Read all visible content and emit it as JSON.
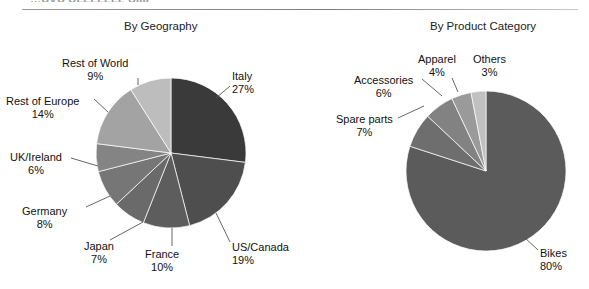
{
  "page": {
    "cut_off_header": "…UVU ULLLLLLL UIIII",
    "background": "#ffffff"
  },
  "charts": [
    {
      "id": "by-geography",
      "title": "By Geography",
      "center": {
        "x": 171,
        "y": 153
      },
      "radius": 75,
      "labels": [
        {
          "name": "rest-of-world",
          "text": "Rest of World",
          "pct": "9%",
          "x": 62,
          "y": 57,
          "align": "center",
          "leader": {
            "x1": 138,
            "y1": 78,
            "x2": 138,
            "y2": 85
          }
        },
        {
          "name": "rest-of-europe",
          "text": "Rest of Europe",
          "pct": "14%",
          "x": 6,
          "y": 95,
          "align": "center",
          "leader": {
            "x1": 94,
            "y1": 99,
            "x2": 108,
            "y2": 112
          }
        },
        {
          "name": "uk-ireland",
          "text": "UK/Ireland",
          "pct": "6%",
          "x": 10,
          "y": 151,
          "align": "center",
          "leader": {
            "x1": 71,
            "y1": 158,
            "x2": 98,
            "y2": 166
          }
        },
        {
          "name": "germany",
          "text": "Germany",
          "pct": "8%",
          "x": 22,
          "y": 205,
          "align": "center",
          "leader": {
            "x1": 86,
            "y1": 207,
            "x2": 110,
            "y2": 196
          }
        },
        {
          "name": "japan",
          "text": "Japan",
          "pct": "7%",
          "x": 84,
          "y": 240,
          "align": "center",
          "leader": {
            "x1": 110,
            "y1": 240,
            "x2": 143,
            "y2": 222
          }
        },
        {
          "name": "france",
          "text": "France",
          "pct": "10%",
          "x": 145,
          "y": 248,
          "align": "center",
          "leader": {
            "x1": 172,
            "y1": 246,
            "x2": 172,
            "y2": 228
          }
        },
        {
          "name": "us-canada",
          "text": "US/Canada",
          "pct": "19%",
          "x": 232,
          "y": 241,
          "align": "left",
          "leader": {
            "x1": 230,
            "y1": 242,
            "x2": 216,
            "y2": 213
          }
        },
        {
          "name": "italy",
          "text": "Italy",
          "pct": "27%",
          "x": 232,
          "y": 70,
          "align": "left",
          "leader": {
            "x1": 230,
            "y1": 86,
            "x2": 216,
            "y2": 98
          }
        }
      ],
      "slices": [
        {
          "name": "Italy",
          "value": 27,
          "color": "#3a3a3a"
        },
        {
          "name": "US/Canada",
          "value": 19,
          "color": "#4e4e4e"
        },
        {
          "name": "France",
          "value": 10,
          "color": "#5d5d5d"
        },
        {
          "name": "Japan",
          "value": 7,
          "color": "#6a6a6a"
        },
        {
          "name": "Germany",
          "value": 8,
          "color": "#767676"
        },
        {
          "name": "UK/Ireland",
          "value": 6,
          "color": "#848484"
        },
        {
          "name": "Rest of Europe",
          "value": 14,
          "color": "#a3a3a3"
        },
        {
          "name": "Rest of World",
          "value": 9,
          "color": "#bdbdbd"
        }
      ]
    },
    {
      "id": "by-product-category",
      "title": "By Product Category",
      "center": {
        "x": 486,
        "y": 171
      },
      "radius": 80,
      "labels": [
        {
          "name": "others",
          "text": "Others",
          "pct": "3%",
          "x": 473,
          "y": 53,
          "align": "center",
          "leader": null
        },
        {
          "name": "apparel",
          "text": "Apparel",
          "pct": "4%",
          "x": 418,
          "y": 53,
          "align": "center",
          "leader": {
            "x1": 452,
            "y1": 78,
            "x2": 458,
            "y2": 92
          }
        },
        {
          "name": "accessories",
          "text": "Accessories",
          "pct": "6%",
          "x": 354,
          "y": 74,
          "align": "center",
          "leader": {
            "x1": 422,
            "y1": 79,
            "x2": 442,
            "y2": 96
          }
        },
        {
          "name": "spare-parts",
          "text": "Spare parts",
          "pct": "7%",
          "x": 336,
          "y": 113,
          "align": "center",
          "leader": {
            "x1": 398,
            "y1": 118,
            "x2": 424,
            "y2": 106
          }
        },
        {
          "name": "bikes",
          "text": "Bikes",
          "pct": "80%",
          "x": 540,
          "y": 247,
          "align": "left",
          "leader": {
            "x1": 538,
            "y1": 250,
            "x2": 524,
            "y2": 237
          }
        }
      ],
      "slices": [
        {
          "name": "Bikes",
          "value": 80,
          "color": "#5b5b5b"
        },
        {
          "name": "Spare parts",
          "value": 7,
          "color": "#6e6e6e"
        },
        {
          "name": "Accessories",
          "value": 6,
          "color": "#828282"
        },
        {
          "name": "Apparel",
          "value": 4,
          "color": "#9a9a9a"
        },
        {
          "name": "Others",
          "value": 3,
          "color": "#c0c0c0"
        }
      ]
    }
  ],
  "chart_data": [
    {
      "type": "pie",
      "title": "By Geography",
      "xlabel": "",
      "ylabel": "",
      "categories": [
        "Italy",
        "US/Canada",
        "France",
        "Japan",
        "Germany",
        "UK/Ireland",
        "Rest of Europe",
        "Rest of World"
      ],
      "values": [
        27,
        19,
        10,
        7,
        8,
        6,
        14,
        9
      ],
      "units": "percent",
      "labels": [
        "Italy 27%",
        "US/Canada 19%",
        "France 10%",
        "Japan 7%",
        "Germany 8%",
        "UK/Ireland 6%",
        "Rest of Europe 14%",
        "Rest of World 9%"
      ],
      "colors": [
        "#3a3a3a",
        "#4e4e4e",
        "#5d5d5d",
        "#6a6a6a",
        "#767676",
        "#848484",
        "#a3a3a3",
        "#bdbdbd"
      ],
      "legend": "none (direct leader-line labels)",
      "start_angle_deg": 0,
      "direction": "clockwise"
    },
    {
      "type": "pie",
      "title": "By Product Category",
      "xlabel": "",
      "ylabel": "",
      "categories": [
        "Bikes",
        "Spare parts",
        "Accessories",
        "Apparel",
        "Others"
      ],
      "values": [
        80,
        7,
        6,
        4,
        3
      ],
      "units": "percent",
      "labels": [
        "Bikes 80%",
        "Spare parts 7%",
        "Accessories 6%",
        "Apparel 4%",
        "Others 3%"
      ],
      "colors": [
        "#5b5b5b",
        "#6e6e6e",
        "#828282",
        "#9a9a9a",
        "#c0c0c0"
      ],
      "legend": "none (direct leader-line labels)",
      "start_angle_deg": 0,
      "direction": "clockwise"
    }
  ]
}
